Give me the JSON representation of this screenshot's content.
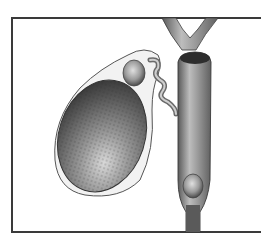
{
  "illustration": {
    "subject": "gallbladder-with-gallstones",
    "parts": [
      "gallbladder",
      "gallstone-neck",
      "cystic-duct",
      "common-bile-duct",
      "hepatic-ducts",
      "gallstone-bile-duct"
    ],
    "colors": {
      "frame": "#3a3a3a",
      "organ_dark": "#4a4a4a",
      "organ_light": "#bdbdbd",
      "background": "#ffffff"
    }
  }
}
